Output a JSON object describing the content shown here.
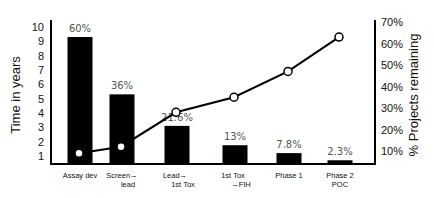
{
  "chart_data": {
    "type": "bar+line",
    "title": "",
    "categories": [
      "Assay dev",
      "Screen→lead",
      "Lead→1st Tox",
      "1st Tox→FIH",
      "Phase 1",
      "Phase 2 POC"
    ],
    "category_lines": [
      [
        "Assay dev"
      ],
      [
        "Screen→",
        "lead"
      ],
      [
        "Lead→",
        "1st Tox"
      ],
      [
        "1st Tox",
        "→FIH"
      ],
      [
        "Phase 1"
      ],
      [
        "Phase 2",
        "POC"
      ]
    ],
    "series": [
      {
        "name": "Time in years",
        "type": "bar",
        "axis": "left",
        "values": [
          9.3,
          5.3,
          3.1,
          1.75,
          1.2,
          0.7
        ],
        "labels": [
          "60%",
          "36%",
          "21.6%",
          "13%",
          "7.8%",
          "2.3%"
        ],
        "color": "#000000"
      },
      {
        "name": "% Projects remaining",
        "type": "line",
        "axis": "right",
        "values": [
          9,
          12,
          28,
          35,
          47,
          63
        ],
        "marker": "open-circle",
        "color": "#000000"
      }
    ],
    "ylabel": "Time in years",
    "yticks": [
      "1",
      "2",
      "3",
      "4",
      "5",
      "6",
      "7",
      "8",
      "9",
      "10"
    ],
    "ylim": [
      0.4,
      10
    ],
    "y2label": "% Projects remaining",
    "y2ticks": [
      "10%",
      "20%",
      "30%",
      "40%",
      "50%",
      "60%",
      "70%"
    ],
    "y2lim": [
      4,
      70
    ],
    "grid": false,
    "legend": "none"
  }
}
